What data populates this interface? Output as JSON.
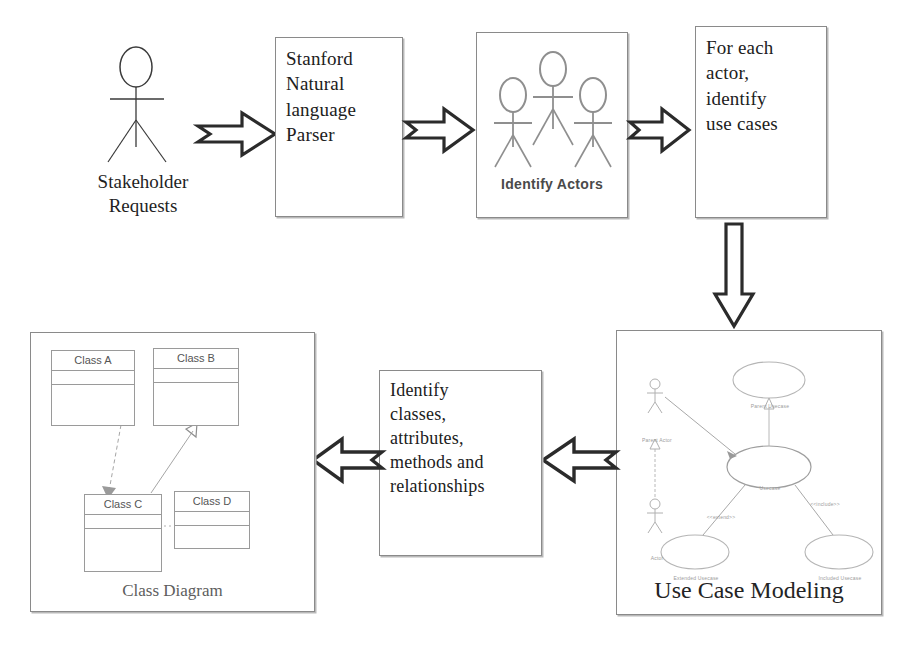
{
  "diagram": {
    "background_color": "#ffffff",
    "line_color": "#8a8a8a",
    "text_color": "#202020"
  },
  "stakeholder": {
    "icon": "stick-figure-actor-icon",
    "caption": "Stakeholder\nRequests"
  },
  "steps": [
    {
      "id": "parser",
      "label": "Stanford\nNatural\nlanguage\nParser"
    },
    {
      "id": "actors",
      "label": "Identify Actors"
    },
    {
      "id": "use_cases",
      "label": "For each\nactor,\nidentify\nuse cases"
    },
    {
      "id": "uc_modeling",
      "label": "Use Case Modeling"
    },
    {
      "id": "identify",
      "label": "Identify\nclasses,\nattributes,\nmethods and\nrelationships"
    },
    {
      "id": "class_diag",
      "label": "Class Diagram"
    }
  ],
  "arrows": [
    {
      "id": "a1",
      "from": "stakeholder",
      "to": "parser",
      "direction": "right",
      "style": "block-arrow"
    },
    {
      "id": "a2",
      "from": "parser",
      "to": "actors",
      "direction": "right",
      "style": "block-arrow"
    },
    {
      "id": "a3",
      "from": "actors",
      "to": "use_cases",
      "direction": "right",
      "style": "block-arrow"
    },
    {
      "id": "a4",
      "from": "use_cases",
      "to": "uc_modeling",
      "direction": "down",
      "style": "block-arrow"
    },
    {
      "id": "a5",
      "from": "uc_modeling",
      "to": "identify",
      "direction": "left",
      "style": "block-arrow"
    },
    {
      "id": "a6",
      "from": "identify",
      "to": "class_diag",
      "direction": "left",
      "style": "block-arrow"
    }
  ],
  "identify_actors_panel": {
    "caption": "Identify Actors",
    "figure_count": 3
  },
  "class_diagram": {
    "caption": "Class Diagram",
    "classes": [
      {
        "id": "A",
        "name": "Class A"
      },
      {
        "id": "B",
        "name": "Class B"
      },
      {
        "id": "C",
        "name": "Class C"
      },
      {
        "id": "D",
        "name": "Class D"
      }
    ],
    "relations": [
      {
        "from": "A",
        "to": "B",
        "type": "association",
        "line": "solid"
      },
      {
        "from": "A",
        "to": "C",
        "type": "dependency",
        "line": "dashed"
      },
      {
        "from": "C",
        "to": "B",
        "type": "generalization",
        "line": "solid"
      },
      {
        "from": "C",
        "to": "D",
        "type": "realization",
        "line": "dotted"
      }
    ]
  },
  "use_case_diagram": {
    "caption": "Use Case Modeling",
    "actors": [
      {
        "id": "parent_actor",
        "label": "Parent Actor"
      },
      {
        "id": "actor",
        "label": "Actor"
      }
    ],
    "use_cases": [
      {
        "id": "parent_uc",
        "label": "Parent Usecase"
      },
      {
        "id": "main_uc",
        "label": "Usecase"
      },
      {
        "id": "extend_uc",
        "label": "Extended Usecase"
      },
      {
        "id": "include_uc",
        "label": "Included Usecase"
      }
    ],
    "stereotypes": [
      {
        "id": "extend",
        "label": "<<extend>>"
      },
      {
        "id": "include",
        "label": "<<include>>"
      }
    ]
  }
}
